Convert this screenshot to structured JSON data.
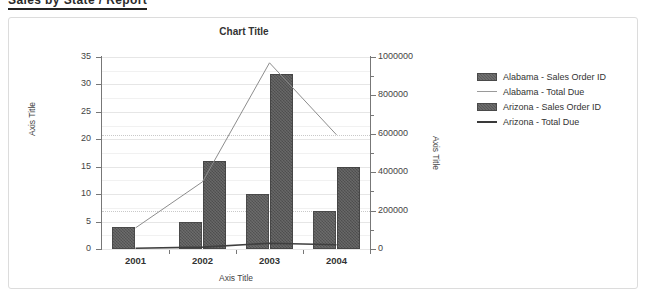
{
  "document": {
    "header_text": "Sales by State / Report"
  },
  "chart": {
    "title": "Chart Title",
    "axis_title_left": "Axis Title",
    "axis_title_right": "Axis Title",
    "axis_title_bottom": "Axis Title"
  },
  "legend": {
    "items": [
      {
        "label": "Alabama - Sales Order ID",
        "marker": "bar",
        "color": "#5b5b5b"
      },
      {
        "label": "Alabama - Total Due",
        "marker": "line",
        "color": "#9a9a9a"
      },
      {
        "label": "Arizona - Sales Order ID",
        "marker": "bar",
        "color": "#575757"
      },
      {
        "label": "Arizona - Total Due",
        "marker": "line",
        "color": "#3a3a3a"
      }
    ]
  },
  "axes": {
    "left_ticks": [
      "0",
      "5",
      "10",
      "15",
      "20",
      "25",
      "30",
      "35"
    ],
    "right_ticks": [
      "0",
      "200000",
      "400000",
      "600000",
      "800000",
      "1000000"
    ],
    "x_ticks": [
      "2001",
      "2002",
      "2003",
      "2004"
    ]
  },
  "chart_data": {
    "type": "bar",
    "title": "Chart Title",
    "xlabel": "Axis Title",
    "ylabel": "Axis Title",
    "y2label": "Axis Title",
    "categories": [
      "2001",
      "2002",
      "2003",
      "2004"
    ],
    "ylim": [
      0,
      35
    ],
    "ytick_step": 5,
    "y2lim": [
      0,
      1000000
    ],
    "y2tick_step": 200000,
    "grid": true,
    "legend_position": "right",
    "series": [
      {
        "name": "Alabama - Sales Order ID",
        "type": "bar",
        "axis": "left",
        "values": [
          4,
          5,
          10,
          7
        ]
      },
      {
        "name": "Alabama - Total Due",
        "type": "line",
        "axis": "right",
        "values": [
          110000,
          350000,
          970000,
          595000
        ]
      },
      {
        "name": "Arizona - Sales Order ID",
        "type": "bar",
        "axis": "left",
        "values": [
          0,
          16,
          32,
          15
        ]
      },
      {
        "name": "Arizona - Total Due",
        "type": "line",
        "axis": "right",
        "values": [
          4000,
          10000,
          30000,
          22000
        ]
      }
    ]
  }
}
